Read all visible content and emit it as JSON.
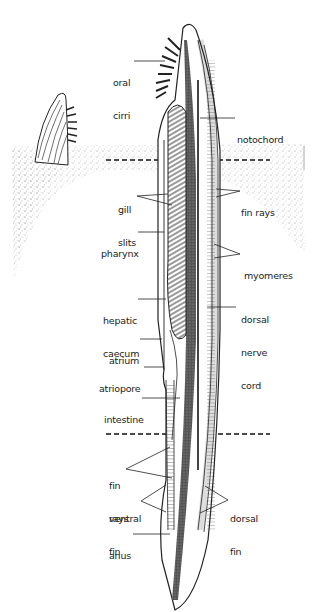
{
  "diagram": {
    "labels": {
      "oral_cirri": [
        "oral",
        "cirri"
      ],
      "notochord": [
        "notochord"
      ],
      "gill_slits": [
        "gill",
        "slits"
      ],
      "fin_rays_upper": [
        "fin rays"
      ],
      "pharynx": [
        "pharynx"
      ],
      "myomeres": [
        "myomeres"
      ],
      "hepatic_caecum": [
        "hepatic",
        "caecum"
      ],
      "dorsal_nerve_cord": [
        "dorsal",
        "nerve",
        "cord"
      ],
      "atrium": [
        "atrium"
      ],
      "atriopore": [
        "atriopore"
      ],
      "intestine": [
        "intestine"
      ],
      "fin_rays_lower": [
        "fin",
        "rays"
      ],
      "ventral_fin": [
        "ventral",
        "fin"
      ],
      "dorsal_fin": [
        "dorsal",
        "fin"
      ],
      "anus": [
        "anus"
      ]
    },
    "colors": {
      "ink": "#222222",
      "sand": "#9a9a9a",
      "background": "#ffffff"
    }
  }
}
